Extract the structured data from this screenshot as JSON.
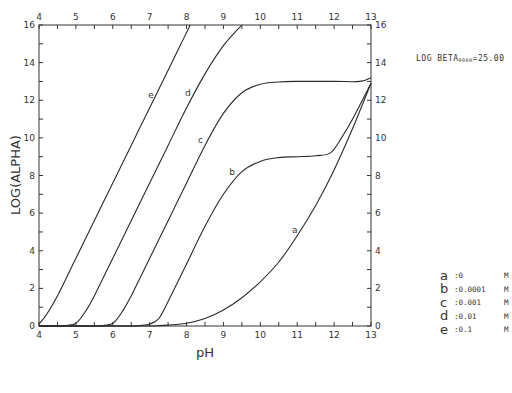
{
  "chart_data": {
    "type": "line",
    "title": "",
    "xlabel": "pH",
    "ylabel": "LOG(ALPHA)",
    "xlim": [
      4,
      13
    ],
    "ylim": [
      0,
      16
    ],
    "x_ticks": [
      4,
      5,
      6,
      7,
      8,
      9,
      10,
      11,
      12,
      13
    ],
    "y_ticks": [
      0,
      2,
      4,
      6,
      8,
      10,
      12,
      14,
      16
    ],
    "grid": false,
    "annotation": {
      "prefix": "LOG BETA",
      "subscript": "0000",
      "suffix": "=25.00"
    },
    "legend_position": "right",
    "series": [
      {
        "name": "a",
        "concentration": "0",
        "unit": "M",
        "points": [
          [
            7.0,
            0.0
          ],
          [
            7.5,
            0.05
          ],
          [
            8.0,
            0.15
          ],
          [
            8.5,
            0.4
          ],
          [
            9.0,
            0.85
          ],
          [
            9.5,
            1.5
          ],
          [
            10.0,
            2.35
          ],
          [
            10.5,
            3.4
          ],
          [
            11.0,
            4.8
          ],
          [
            11.5,
            6.4
          ],
          [
            12.0,
            8.3
          ],
          [
            12.5,
            10.5
          ],
          [
            13.0,
            12.9
          ]
        ]
      },
      {
        "name": "b",
        "concentration": "0.0001",
        "unit": "M",
        "points": [
          [
            6.6,
            0.0
          ],
          [
            7.0,
            0.1
          ],
          [
            7.25,
            0.4
          ],
          [
            7.5,
            1.3
          ],
          [
            8.0,
            3.3
          ],
          [
            8.5,
            5.3
          ],
          [
            9.0,
            7.0
          ],
          [
            9.5,
            8.2
          ],
          [
            10.0,
            8.75
          ],
          [
            10.5,
            8.95
          ],
          [
            11.0,
            9.0
          ],
          [
            11.5,
            9.05
          ],
          [
            11.9,
            9.2
          ],
          [
            12.2,
            10.0
          ],
          [
            12.5,
            11.0
          ],
          [
            13.0,
            12.9
          ]
        ]
      },
      {
        "name": "c",
        "concentration": "0.001",
        "unit": "M",
        "points": [
          [
            5.6,
            0.0
          ],
          [
            6.0,
            0.15
          ],
          [
            6.3,
            0.9
          ],
          [
            6.5,
            1.6
          ],
          [
            7.0,
            3.6
          ],
          [
            7.5,
            5.6
          ],
          [
            8.0,
            7.6
          ],
          [
            8.5,
            9.6
          ],
          [
            9.0,
            11.3
          ],
          [
            9.5,
            12.4
          ],
          [
            10.0,
            12.85
          ],
          [
            10.5,
            12.97
          ],
          [
            11.0,
            13.0
          ],
          [
            12.0,
            13.0
          ],
          [
            12.7,
            13.0
          ],
          [
            13.0,
            13.2
          ]
        ]
      },
      {
        "name": "d",
        "concentration": "0.01",
        "unit": "M",
        "points": [
          [
            4.6,
            0.0
          ],
          [
            5.0,
            0.15
          ],
          [
            5.3,
            0.9
          ],
          [
            5.5,
            1.6
          ],
          [
            6.0,
            3.6
          ],
          [
            6.5,
            5.6
          ],
          [
            7.0,
            7.6
          ],
          [
            7.5,
            9.6
          ],
          [
            8.0,
            11.6
          ],
          [
            8.5,
            13.4
          ],
          [
            9.0,
            14.9
          ],
          [
            9.5,
            16.0
          ]
        ]
      },
      {
        "name": "e",
        "concentration": "0.1",
        "unit": "M",
        "points": [
          [
            4.0,
            0.1
          ],
          [
            4.2,
            0.6
          ],
          [
            4.5,
            1.6
          ],
          [
            5.0,
            3.6
          ],
          [
            5.5,
            5.6
          ],
          [
            6.0,
            7.6
          ],
          [
            6.5,
            9.6
          ],
          [
            7.0,
            11.6
          ],
          [
            7.5,
            13.6
          ],
          [
            7.8,
            14.8
          ],
          [
            8.1,
            16.0
          ]
        ]
      }
    ]
  },
  "axes": {
    "xlabel": "pH",
    "ylabel": "LOG(ALPHA)",
    "x_ticks": [
      "4",
      "5",
      "6",
      "7",
      "8",
      "9",
      "10",
      "11",
      "12",
      "13"
    ],
    "y_ticks": [
      "0",
      "2",
      "4",
      "6",
      "8",
      "10",
      "12",
      "14",
      "16"
    ]
  },
  "annotation": {
    "prefix": "LOG BETA",
    "subscript": "0000",
    "suffix": "=25.00"
  },
  "legend": [
    {
      "key": "a",
      "value": ":0",
      "unit": "M"
    },
    {
      "key": "b",
      "value": ":0.0001",
      "unit": "M"
    },
    {
      "key": "c",
      "value": ":0.001",
      "unit": "M"
    },
    {
      "key": "d",
      "value": ":0.01",
      "unit": "M"
    },
    {
      "key": "e",
      "value": ":0.1",
      "unit": "M"
    }
  ],
  "curve_labels": [
    {
      "text": "a",
      "ph": 11.05,
      "log": 5.1
    },
    {
      "text": "b",
      "ph": 9.35,
      "log": 8.2
    },
    {
      "text": "c",
      "ph": 8.5,
      "log": 9.9
    },
    {
      "text": "d",
      "ph": 8.15,
      "log": 12.4
    },
    {
      "text": "e",
      "ph": 7.15,
      "log": 12.3
    }
  ]
}
